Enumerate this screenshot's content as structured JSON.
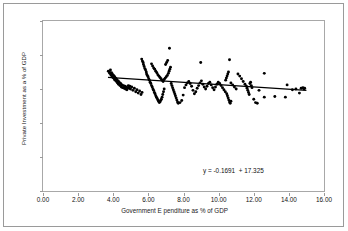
{
  "chart_data": {
    "type": "scatter",
    "title": "",
    "xlabel": "Government E  penditure as % of GDP",
    "ylabel": "Private Investment as a % of GDP",
    "xlim": [
      0.0,
      16.0
    ],
    "ylim": [
      0,
      25
    ],
    "xticks": [
      "0.00",
      "2.00",
      "4.00",
      "6.00",
      "8.00",
      "10.00",
      "12.00",
      "14.00",
      "16.00"
    ],
    "xtick_values": [
      0,
      2,
      4,
      6,
      8,
      10,
      12,
      14,
      16
    ],
    "yticks": [
      "0",
      "5",
      "10",
      "15",
      "20",
      "25"
    ],
    "ytick_values": [
      0,
      5,
      10,
      15,
      20,
      25
    ],
    "grid": false,
    "legend": false,
    "marker": "filled-diamond",
    "marker_color": "#000000",
    "annotation": "y = -0.1691  + 17.325",
    "trendline": {
      "type": "linear",
      "slope": -0.1691,
      "intercept": 17.325,
      "x_start": 3.7,
      "x_end": 15.0,
      "color": "#000000"
    },
    "points": [
      [
        3.72,
        17.6
      ],
      [
        3.78,
        17.5
      ],
      [
        3.8,
        17.3
      ],
      [
        3.84,
        17.8
      ],
      [
        3.86,
        17.1
      ],
      [
        3.9,
        17.4
      ],
      [
        3.92,
        16.9
      ],
      [
        3.95,
        17.2
      ],
      [
        3.98,
        16.7
      ],
      [
        4.02,
        17.0
      ],
      [
        4.05,
        16.5
      ],
      [
        4.08,
        16.8
      ],
      [
        4.1,
        16.3
      ],
      [
        4.14,
        16.6
      ],
      [
        4.18,
        16.1
      ],
      [
        4.2,
        16.4
      ],
      [
        4.24,
        15.9
      ],
      [
        4.28,
        16.2
      ],
      [
        4.3,
        15.7
      ],
      [
        4.34,
        16.0
      ],
      [
        4.38,
        15.5
      ],
      [
        4.42,
        15.8
      ],
      [
        4.46,
        15.3
      ],
      [
        4.5,
        15.6
      ],
      [
        4.54,
        15.2
      ],
      [
        4.58,
        15.5
      ],
      [
        4.62,
        15.1
      ],
      [
        4.66,
        15.4
      ],
      [
        4.7,
        15.0
      ],
      [
        4.74,
        15.3
      ],
      [
        4.78,
        14.9
      ],
      [
        4.82,
        15.2
      ],
      [
        4.86,
        15.5
      ],
      [
        4.9,
        15.1
      ],
      [
        4.94,
        15.4
      ],
      [
        4.98,
        15.0
      ],
      [
        5.05,
        15.3
      ],
      [
        5.12,
        14.8
      ],
      [
        5.2,
        15.1
      ],
      [
        5.28,
        14.6
      ],
      [
        5.35,
        14.9
      ],
      [
        5.42,
        14.4
      ],
      [
        5.5,
        14.7
      ],
      [
        5.58,
        14.2
      ],
      [
        5.64,
        14.5
      ],
      [
        5.62,
        19.4
      ],
      [
        5.66,
        19.1
      ],
      [
        5.7,
        18.9
      ],
      [
        5.72,
        18.6
      ],
      [
        5.76,
        18.3
      ],
      [
        5.8,
        18.0
      ],
      [
        5.84,
        17.8
      ],
      [
        5.88,
        17.5
      ],
      [
        5.9,
        17.2
      ],
      [
        5.94,
        17.0
      ],
      [
        5.98,
        16.8
      ],
      [
        6.02,
        16.5
      ],
      [
        6.06,
        16.3
      ],
      [
        6.1,
        16.0
      ],
      [
        6.14,
        15.8
      ],
      [
        6.18,
        15.5
      ],
      [
        6.22,
        15.3
      ],
      [
        6.26,
        15.0
      ],
      [
        6.3,
        14.8
      ],
      [
        6.34,
        14.5
      ],
      [
        6.38,
        14.3
      ],
      [
        6.42,
        14.0
      ],
      [
        6.46,
        13.8
      ],
      [
        6.5,
        13.6
      ],
      [
        6.54,
        13.4
      ],
      [
        6.58,
        13.2
      ],
      [
        6.62,
        13.0
      ],
      [
        6.66,
        13.1
      ],
      [
        6.7,
        13.3
      ],
      [
        6.74,
        13.5
      ],
      [
        6.78,
        13.8
      ],
      [
        6.82,
        14.2
      ],
      [
        6.86,
        14.6
      ],
      [
        6.9,
        15.0
      ],
      [
        6.18,
        18.7
      ],
      [
        6.24,
        18.4
      ],
      [
        6.3,
        18.1
      ],
      [
        6.36,
        17.9
      ],
      [
        6.42,
        17.6
      ],
      [
        6.48,
        17.4
      ],
      [
        6.54,
        17.1
      ],
      [
        6.6,
        16.9
      ],
      [
        6.66,
        16.7
      ],
      [
        6.72,
        16.5
      ],
      [
        6.78,
        16.3
      ],
      [
        6.84,
        16.1
      ],
      [
        6.9,
        16.4
      ],
      [
        6.96,
        16.6
      ],
      [
        7.02,
        16.8
      ],
      [
        7.08,
        17.0
      ],
      [
        7.14,
        17.3
      ],
      [
        7.18,
        17.6
      ],
      [
        7.22,
        17.9
      ],
      [
        7.26,
        18.2
      ],
      [
        7.2,
        21.0
      ],
      [
        7.1,
        19.2
      ],
      [
        7.04,
        18.9
      ],
      [
        6.98,
        18.6
      ],
      [
        7.3,
        15.8
      ],
      [
        7.34,
        15.5
      ],
      [
        7.38,
        15.2
      ],
      [
        7.42,
        14.9
      ],
      [
        7.46,
        14.6
      ],
      [
        7.5,
        14.3
      ],
      [
        7.54,
        14.0
      ],
      [
        7.58,
        13.7
      ],
      [
        7.62,
        13.4
      ],
      [
        7.66,
        13.1
      ],
      [
        7.7,
        12.9
      ],
      [
        7.8,
        13.0
      ],
      [
        7.9,
        13.3
      ],
      [
        7.98,
        14.1
      ],
      [
        8.06,
        15.2
      ],
      [
        8.14,
        15.6
      ],
      [
        8.22,
        15.9
      ],
      [
        8.3,
        16.1
      ],
      [
        8.38,
        15.8
      ],
      [
        8.46,
        15.4
      ],
      [
        8.54,
        14.8
      ],
      [
        8.62,
        14.3
      ],
      [
        8.7,
        14.6
      ],
      [
        8.78,
        15.1
      ],
      [
        8.86,
        15.5
      ],
      [
        8.94,
        15.9
      ],
      [
        9.02,
        16.2
      ],
      [
        9.1,
        15.7
      ],
      [
        9.18,
        15.3
      ],
      [
        9.26,
        15.0
      ],
      [
        9.34,
        15.4
      ],
      [
        9.42,
        15.8
      ],
      [
        9.5,
        16.0
      ],
      [
        9.58,
        15.6
      ],
      [
        9.66,
        15.2
      ],
      [
        9.74,
        14.9
      ],
      [
        9.82,
        15.3
      ],
      [
        9.9,
        15.7
      ],
      [
        8.98,
        18.9
      ],
      [
        9.98,
        16.0
      ],
      [
        10.06,
        15.8
      ],
      [
        10.14,
        15.5
      ],
      [
        10.22,
        15.2
      ],
      [
        10.3,
        14.9
      ],
      [
        10.38,
        14.6
      ],
      [
        10.46,
        14.3
      ],
      [
        10.5,
        14.0
      ],
      [
        10.54,
        13.7
      ],
      [
        10.58,
        13.4
      ],
      [
        10.62,
        13.1
      ],
      [
        10.66,
        12.9
      ],
      [
        10.7,
        13.2
      ],
      [
        10.4,
        16.3
      ],
      [
        10.44,
        16.6
      ],
      [
        10.48,
        16.9
      ],
      [
        10.52,
        17.2
      ],
      [
        10.56,
        17.5
      ],
      [
        10.62,
        19.3
      ],
      [
        10.7,
        15.9
      ],
      [
        10.8,
        15.6
      ],
      [
        10.9,
        15.3
      ],
      [
        11.0,
        15.0
      ],
      [
        11.1,
        17.2
      ],
      [
        11.2,
        16.9
      ],
      [
        11.3,
        16.5
      ],
      [
        11.4,
        16.1
      ],
      [
        11.5,
        15.7
      ],
      [
        11.58,
        15.4
      ],
      [
        11.62,
        15.1
      ],
      [
        11.66,
        14.8
      ],
      [
        11.7,
        14.5
      ],
      [
        11.74,
        14.2
      ],
      [
        11.78,
        15.8
      ],
      [
        11.82,
        16.0
      ],
      [
        11.86,
        15.5
      ],
      [
        11.9,
        15.2
      ],
      [
        12.0,
        13.5
      ],
      [
        12.1,
        13.0
      ],
      [
        12.2,
        12.9
      ],
      [
        12.3,
        14.8
      ],
      [
        12.6,
        17.3
      ],
      [
        12.6,
        13.8
      ],
      [
        13.2,
        13.9
      ],
      [
        13.8,
        13.8
      ],
      [
        13.9,
        15.6
      ],
      [
        14.2,
        14.9
      ],
      [
        14.4,
        15.0
      ],
      [
        14.6,
        14.4
      ],
      [
        14.7,
        15.1
      ],
      [
        14.8,
        15.2
      ],
      [
        14.86,
        15.0
      ],
      [
        14.9,
        15.1
      ]
    ]
  }
}
